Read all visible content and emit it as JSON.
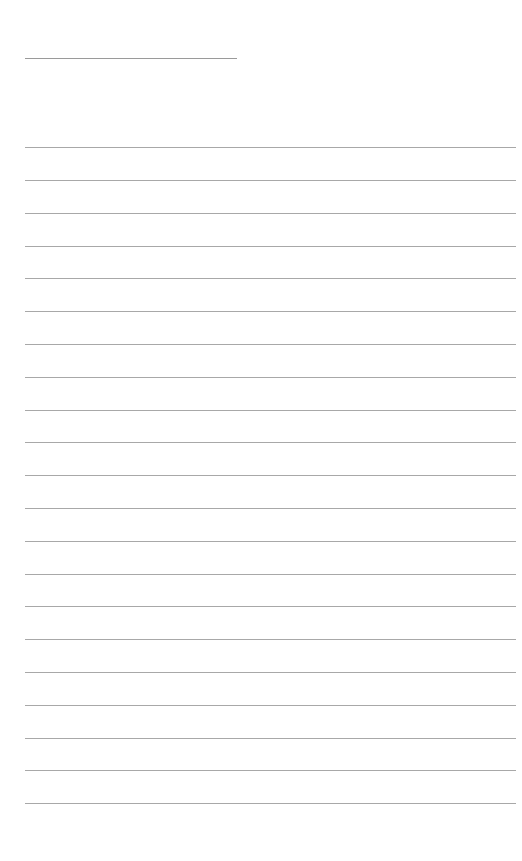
{
  "page": {
    "type": "blank lined writing page",
    "header_line": {
      "x": 25,
      "y": 58,
      "width": 212
    },
    "rules": {
      "count": 21,
      "x": 25,
      "width": 491,
      "positions": [
        147,
        180,
        213,
        246,
        278,
        311,
        344,
        377,
        410,
        442,
        475,
        508,
        541,
        574,
        606,
        639,
        672,
        705,
        738,
        770,
        803
      ]
    },
    "colors": {
      "background": "#ffffff",
      "line": "#a8a8a8"
    }
  }
}
